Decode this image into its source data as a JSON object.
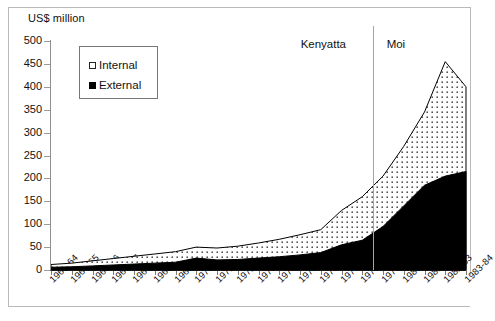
{
  "figure": {
    "y_axis_title": "US$ million",
    "annotations": [
      {
        "name": "kenyatta",
        "label": "Kenyatta"
      },
      {
        "name": "moi",
        "label": "Moi"
      }
    ],
    "legend": {
      "items": [
        {
          "name": "internal",
          "label": "Internal",
          "marker": "open-square-swatch",
          "color": "#ffffff"
        },
        {
          "name": "external",
          "label": "External",
          "marker": "filled-square-swatch",
          "color": "#000000"
        }
      ]
    }
  },
  "chart_data": {
    "type": "area",
    "stacked": true,
    "title": "",
    "xlabel": "",
    "ylabel": "US$ million",
    "ylim": [
      0,
      500
    ],
    "yticks": [
      0,
      50,
      100,
      150,
      200,
      250,
      300,
      350,
      400,
      450,
      500
    ],
    "grid": false,
    "legend_position": "upper-left-inside",
    "categories": [
      "1963-64",
      "1964-65",
      "1965-66",
      "1966-67",
      "1967-68",
      "1968-69",
      "1969-70",
      "1970-71",
      "1971-72",
      "1972-73",
      "1973-74",
      "1974-75",
      "1975-76",
      "1976-77",
      "1977-78",
      "1978-79",
      "1979-80",
      "1980-81",
      "1981-82",
      "1982-83",
      "1983-84"
    ],
    "series": [
      {
        "name": "External",
        "color": "#000000",
        "values": [
          6,
          7,
          9,
          11,
          13,
          15,
          17,
          26,
          22,
          23,
          26,
          29,
          33,
          38,
          55,
          65,
          95,
          140,
          185,
          205,
          215
        ]
      },
      {
        "name": "Internal",
        "color": "#ffffff",
        "values": [
          6,
          8,
          11,
          14,
          17,
          20,
          23,
          24,
          26,
          29,
          33,
          38,
          44,
          50,
          75,
          95,
          110,
          130,
          160,
          250,
          185
        ]
      }
    ],
    "totals": [
      12,
      15,
      20,
      25,
      30,
      35,
      40,
      50,
      48,
      52,
      59,
      67,
      77,
      88,
      130,
      160,
      205,
      270,
      345,
      455,
      400
    ],
    "annotations": [
      {
        "text": "Kenyatta",
        "span": [
          "1963-64",
          "1978-79"
        ]
      },
      {
        "text": "Moi",
        "span": [
          "1979-80",
          "1983-84"
        ]
      },
      {
        "type": "vline",
        "at": "1978-79/1979-80"
      }
    ]
  }
}
